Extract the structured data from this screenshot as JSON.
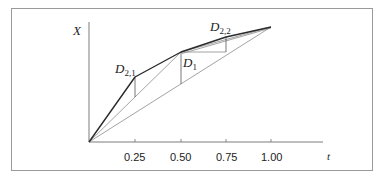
{
  "diagram": {
    "y_axis_label": "X",
    "x_axis_label": "t",
    "x_ticks": [
      "0.25",
      "0.50",
      "0.75",
      "1.00"
    ],
    "labels": {
      "d21_main": "D",
      "d21_sub": "2,1",
      "d1_main": "D",
      "d1_sub": "1",
      "d22_main": "D",
      "d22_sub": "2,2"
    },
    "colors": {
      "path": "#2a2a2a",
      "chord": "#8c8c8c",
      "axis": "#6e6e6e"
    }
  }
}
